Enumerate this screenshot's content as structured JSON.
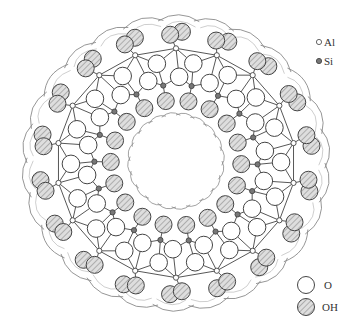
{
  "diagram": {
    "type": "molecular-structure-cross-section",
    "center": [
      176,
      163
    ],
    "units": 18,
    "colors": {
      "line": "#444444",
      "boundary": "#8a8a8a",
      "oh_fill": "#d9d9d9",
      "oh_hatch": "#8c8c8c",
      "o_fill": "#ffffff",
      "al_fill": "#ffffff",
      "si_fill": "#777777"
    }
  },
  "legend": {
    "top": [
      {
        "symbol": "al-small-open-circle",
        "label": "Al"
      },
      {
        "symbol": "si-small-filled-circle",
        "label": "Si"
      }
    ],
    "bottom": [
      {
        "symbol": "o-large-open-circle",
        "label": "O"
      },
      {
        "symbol": "oh-large-hatched-circle",
        "label": "OH"
      }
    ]
  }
}
